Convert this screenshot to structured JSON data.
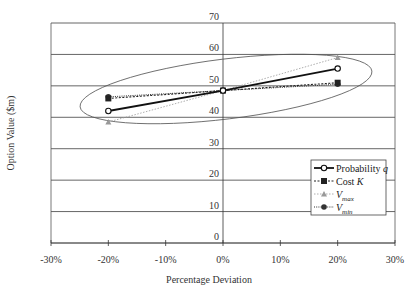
{
  "chart_data": {
    "type": "line",
    "title": "",
    "xlabel": "Percentage Deviation",
    "ylabel": "Option Value ($m)",
    "x": [
      -20,
      0,
      20
    ],
    "x_tick_labels": [
      "-30%",
      "-20%",
      "-10%",
      "0%",
      "10%",
      "20%",
      "30%"
    ],
    "x_ticks": [
      -30,
      -20,
      -10,
      0,
      10,
      20,
      30
    ],
    "xlim": [
      -30,
      30
    ],
    "y_ticks": [
      0,
      10,
      20,
      30,
      40,
      50,
      60,
      70
    ],
    "ylim": [
      0,
      70
    ],
    "grid": "horizontal",
    "legend_position": "lower right inside",
    "series": [
      {
        "name": "Probability q",
        "label_main": "Probability ",
        "label_italic": "q",
        "values": [
          42,
          48.5,
          55.5
        ],
        "marker": "open-circle",
        "line": "solid-thick",
        "color": "#111111"
      },
      {
        "name": "Cost K",
        "label_main": "Cost ",
        "label_italic": "K",
        "values": [
          46,
          48.5,
          51
        ],
        "marker": "square",
        "line": "dashed",
        "color": "#222222"
      },
      {
        "name": "Vmax",
        "label_main": "V",
        "label_sub": "max",
        "values": [
          38.5,
          48.5,
          59
        ],
        "marker": "triangle",
        "line": "dotted-light",
        "color": "#999999"
      },
      {
        "name": "Vmin",
        "label_main": "V",
        "label_sub": "min",
        "values": [
          46.5,
          48.5,
          50.5
        ],
        "marker": "filled-circle",
        "line": "dotted",
        "color": "#333333"
      }
    ],
    "annotations": [
      {
        "type": "ellipse",
        "description": "Tilted ellipse encircling all series data points"
      }
    ]
  }
}
